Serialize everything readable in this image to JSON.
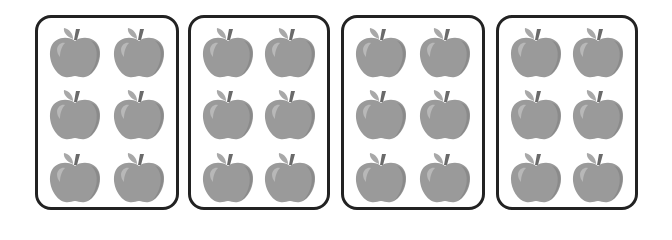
{
  "diagram": {
    "group_count": 4,
    "apples_per_group": 6,
    "layout": {
      "rows": 3,
      "columns": 2
    },
    "groups": [
      {
        "id": 1,
        "apples": 6,
        "left": 35,
        "width": 144
      },
      {
        "id": 2,
        "apples": 6,
        "left": 188,
        "width": 142
      },
      {
        "id": 3,
        "apples": 6,
        "left": 341,
        "width": 144
      },
      {
        "id": 4,
        "apples": 6,
        "left": 496,
        "width": 142
      }
    ],
    "colors": {
      "apple_body": "#9a9a9a",
      "apple_shade": "#8a8a8a",
      "apple_highlight": "#b8b8b8",
      "leaf": "#a8a8a8",
      "stem": "#6a6a6a",
      "box_border": "#222222"
    },
    "icon": "apple-icon"
  }
}
